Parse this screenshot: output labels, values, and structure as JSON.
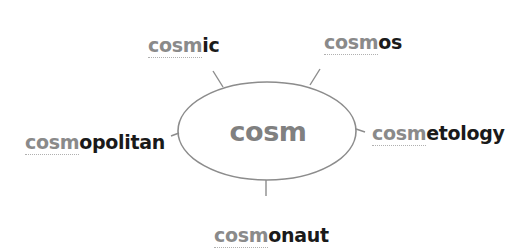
{
  "diagram": {
    "type": "word-web",
    "center": {
      "label": "cosm"
    },
    "branches": [
      {
        "id": "cosmic",
        "prefix": "cosm",
        "suffix": "ic"
      },
      {
        "id": "cosmos",
        "prefix": "cosm",
        "suffix": "os"
      },
      {
        "id": "cosmopolitan",
        "prefix": "cosm",
        "suffix": "opolitan"
      },
      {
        "id": "cosmetology",
        "prefix": "cosm",
        "suffix": "etology"
      },
      {
        "id": "cosmonaut",
        "prefix": "cosm",
        "suffix": "onaut"
      }
    ],
    "colors": {
      "ellipse_stroke": "#8c8c8c",
      "connector_stroke": "#8c8c8c",
      "center_text": "#808080",
      "prefix_text": "#8a8a8a",
      "suffix_text": "#1a1a1a",
      "background": "#ffffff"
    }
  }
}
